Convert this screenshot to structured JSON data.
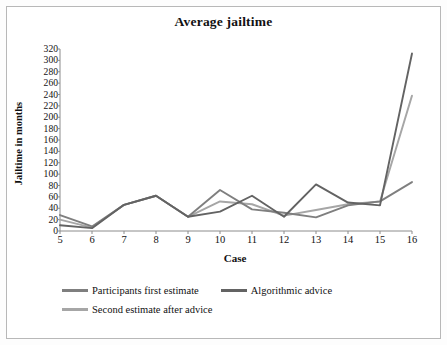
{
  "chart_data": {
    "type": "line",
    "title": "Average jailtime",
    "xlabel": "Case",
    "ylabel": "Jailtime in months",
    "categories": [
      5,
      6,
      7,
      8,
      9,
      10,
      11,
      12,
      13,
      14,
      15,
      16
    ],
    "ylim": [
      0,
      320
    ],
    "ytick_step": 20,
    "yticks": [
      320,
      300,
      280,
      260,
      240,
      220,
      200,
      180,
      160,
      140,
      120,
      100,
      80,
      60,
      40,
      20,
      0
    ],
    "xticks": [
      "5",
      "6",
      "7",
      "8",
      "9",
      "10",
      "11",
      "12",
      "13",
      "14",
      "15",
      "16"
    ],
    "grid": false,
    "legend_position": "bottom",
    "series": [
      {
        "name": "Participants first estimate",
        "color": "#7f7f7f",
        "values": [
          28,
          8,
          46,
          62,
          25,
          72,
          38,
          32,
          24,
          45,
          52,
          86
        ]
      },
      {
        "name": "Algorithmic advice",
        "color": "#636363",
        "values": [
          10,
          5,
          46,
          62,
          25,
          34,
          62,
          25,
          82,
          50,
          45,
          312
        ]
      },
      {
        "name": "Second estimate after advice",
        "color": "#a6a6a6",
        "values": [
          20,
          6,
          46,
          62,
          25,
          52,
          47,
          27,
          37,
          47,
          52,
          238
        ]
      }
    ]
  },
  "legend": {
    "items": [
      {
        "label": "Participants first estimate",
        "color": "#7f7f7f"
      },
      {
        "label": "Algorithmic advice",
        "color": "#636363"
      },
      {
        "label": "Second estimate after advice",
        "color": "#a6a6a6"
      }
    ]
  }
}
